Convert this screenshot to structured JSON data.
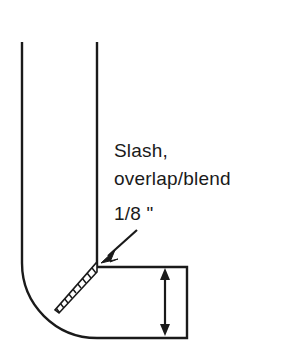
{
  "diagram": {
    "background_color": "#ffffff",
    "line_color": "#1a1a1a",
    "hatch_color": "#1a1a1a",
    "labels": {
      "callout_line1": "Slash,",
      "callout_line2": "overlap/blend",
      "dimension_label": "1/8 \""
    },
    "icons": {
      "callout_arrow": "arrow-down-left-icon",
      "dimension_arrow": "double-headed-vertical-arrow-icon"
    },
    "geometry": {
      "vertical_arm": {
        "left_x": 22,
        "right_x": 97,
        "top_y": 42,
        "bend_start_y": 262
      },
      "horizontal_arm": {
        "top_y": 267,
        "bottom_y": 338,
        "right_x": 187,
        "left_x": 97
      },
      "outer_arc": {
        "center_x": 97,
        "center_y": 263,
        "radius": 75
      },
      "slash_band": {
        "start_x": 97,
        "start_y": 263,
        "end_x": 58,
        "end_y": 312,
        "hatch_count": 9
      }
    },
    "callout_arrow_path": {
      "tail_x": 137,
      "tail_y": 230,
      "tip_x": 101,
      "tip_y": 263
    },
    "dimension_arrow": {
      "x": 165,
      "top_y": 269,
      "bottom_y": 335
    }
  }
}
